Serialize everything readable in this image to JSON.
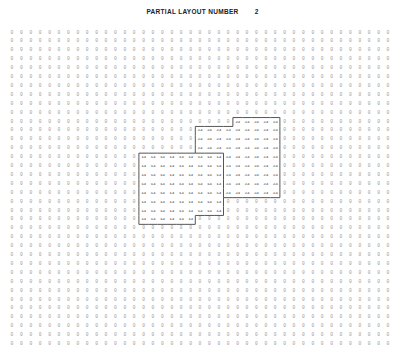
{
  "title": {
    "label": "PARTIAL LAYOUT NUMBER",
    "number": "2"
  },
  "grid": {
    "columns": 41,
    "rows": 36,
    "origin_x": 12,
    "origin_y": 33,
    "col_spacing": 9.4,
    "row_spacing": 8.9,
    "default_value": "0",
    "regions": [
      {
        "id": "region-14",
        "value": "14",
        "row_spans": [
          {
            "row": 14,
            "from": 14,
            "to": 22
          },
          {
            "row": 15,
            "from": 14,
            "to": 22
          },
          {
            "row": 16,
            "from": 14,
            "to": 22
          },
          {
            "row": 17,
            "from": 14,
            "to": 22
          },
          {
            "row": 18,
            "from": 14,
            "to": 22
          },
          {
            "row": 19,
            "from": 14,
            "to": 22
          },
          {
            "row": 20,
            "from": 14,
            "to": 22
          },
          {
            "row": 21,
            "from": 14,
            "to": 19
          }
        ]
      },
      {
        "id": "region-24",
        "value": "24",
        "row_spans": [
          {
            "row": 10,
            "from": 24,
            "to": 28
          },
          {
            "row": 11,
            "from": 20,
            "to": 28
          },
          {
            "row": 12,
            "from": 20,
            "to": 28
          },
          {
            "row": 13,
            "from": 20,
            "to": 28
          },
          {
            "row": 14,
            "from": 23,
            "to": 28
          },
          {
            "row": 15,
            "from": 23,
            "to": 28
          },
          {
            "row": 16,
            "from": 23,
            "to": 28
          },
          {
            "row": 17,
            "from": 23,
            "to": 28
          },
          {
            "row": 18,
            "from": 23,
            "to": 28
          }
        ]
      }
    ],
    "colors": {
      "zero_text": "#9a9a9a",
      "region_text": "#444444",
      "border": "#555555"
    }
  }
}
